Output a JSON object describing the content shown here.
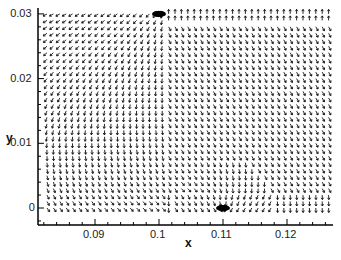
{
  "chart_data": {
    "type": "vector_field",
    "title": "",
    "xlabel": "x",
    "ylabel": "y",
    "xlim": [
      0.0815,
      0.1275
    ],
    "ylim": [
      -0.0025,
      0.0305
    ],
    "x_ticks": [
      {
        "value": 0.09,
        "label": "0.09"
      },
      {
        "value": 0.1,
        "label": "0.1"
      },
      {
        "value": 0.11,
        "label": "0.11"
      },
      {
        "value": 0.12,
        "label": "0.12"
      }
    ],
    "y_ticks": [
      {
        "value": 0,
        "label": "0"
      },
      {
        "value": 0.01,
        "label": "0.01"
      },
      {
        "value": 0.02,
        "label": "0.02"
      },
      {
        "value": 0.03,
        "label": "0.03"
      }
    ],
    "minor_tick_step": 0.002,
    "grid": false,
    "legend": null,
    "features": [
      {
        "kind": "source_jet",
        "x": 0.1,
        "y": 0.03,
        "description": "dense arrow cluster at top wall"
      },
      {
        "kind": "sink",
        "x": 0.11,
        "y": 0.0,
        "description": "dense arrow convergence at bottom wall"
      }
    ],
    "flow_description": {
      "left_region_top": "arrows point left (-x)",
      "left_region_middle": "arrows point down-left",
      "left_region_bottom": "arrows point right (+x) toward sink",
      "right_region": "arrows point diagonally down-right",
      "right_top_row": "arrows point up (+y) at y=0.03",
      "right_bottom_row": "arrows point down (-y) at y=0"
    },
    "arrow_grid_spacing": 0.001
  },
  "axes": {
    "x_title": "x",
    "y_title": "y"
  }
}
